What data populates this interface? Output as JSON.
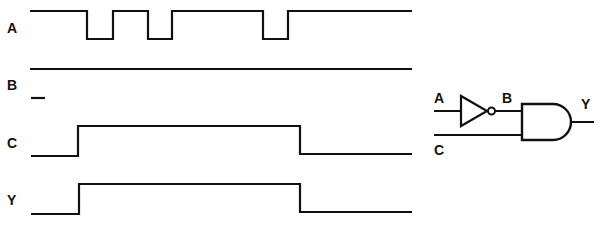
{
  "timing_diagram": {
    "signals": [
      {
        "name": "A",
        "label_pos": [
          9,
          33
        ],
        "points": "30,11 87,11 87,39 113,39 113,11 148,11 148,39 172,39 172,11 263,11 263,39 288,39 288,11 412,11"
      },
      {
        "name": "B",
        "label_pos": [
          9,
          90
        ],
        "points": "30,69 412,69"
      },
      {
        "name": "C",
        "label_pos": [
          9,
          148
        ],
        "points": "31,156 78,156 78,126 300,126 300,154 412,154"
      },
      {
        "name": "Y",
        "label_pos": [
          9,
          205
        ],
        "points": "31,214 79,214 79,184 300,184 300,212 412,212"
      }
    ],
    "extra_marks": [
      {
        "name": "b-low-level-mark",
        "points": "31,98 45,98"
      }
    ]
  },
  "logic_circuit": {
    "labels": {
      "input_a": "A",
      "node_b": "B",
      "input_c": "C",
      "output_y": "Y"
    },
    "gates": [
      "NOT",
      "AND"
    ]
  }
}
